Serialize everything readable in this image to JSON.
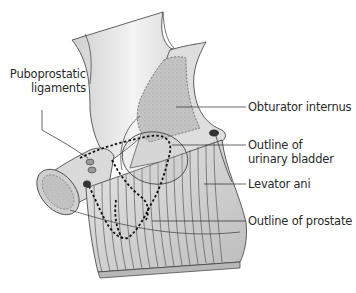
{
  "diagram": {
    "labels": {
      "puboprostatic_line1": "Puboprostatic",
      "puboprostatic_line2": "ligaments",
      "obturator_internus": "Obturator internus",
      "bladder_line1": "Outline of",
      "bladder_line2": "urinary bladder",
      "levator_ani": "Levator ani",
      "prostate": "Outline of prostate"
    },
    "colors": {
      "background": "#ffffff",
      "bone": "#dcdcdc",
      "bone_light": "#efefef",
      "muscle": "#c8c8c8",
      "stipple": "#b5b5b5",
      "outline": "#3a3a3a",
      "dashed": "#111111",
      "text": "#2a2a2a"
    }
  }
}
